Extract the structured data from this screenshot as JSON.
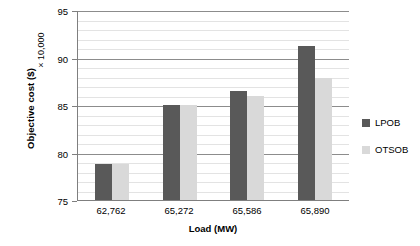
{
  "chart_data": {
    "type": "bar",
    "title": "",
    "subtitle": "",
    "xlabel": "Load (MW)",
    "ylabel": "Objective cost ($)",
    "y_multiplier_label": "× 10,000",
    "categories": [
      "62,762",
      "65,272",
      "65,586",
      "65,890"
    ],
    "series": [
      {
        "name": "LPOB",
        "color": "#595959",
        "values": [
          78.8,
          85.0,
          86.5,
          91.2
        ]
      },
      {
        "name": "OTSOB",
        "color": "#d9d9d9",
        "values": [
          78.8,
          85.0,
          86.0,
          87.8
        ]
      }
    ],
    "ylim": [
      75,
      95
    ],
    "y_major_ticks": [
      75,
      80,
      85,
      90,
      95
    ],
    "y_major_tick_labels": [
      "75",
      "80",
      "85",
      "90",
      "95"
    ],
    "y_minor_interval": 1,
    "grid": true,
    "grid_axis": "y",
    "legend_position": "right",
    "legend_entries": [
      "LPOB",
      "OTSOB"
    ]
  },
  "colors": {
    "lpob": "#595959",
    "otsob": "#d9d9d9",
    "axis": "#7f7f7f",
    "gridline_major": "#8c8c8c",
    "gridline_minor": "#e3e3e3",
    "background": "#ffffff",
    "text": "#000000"
  }
}
